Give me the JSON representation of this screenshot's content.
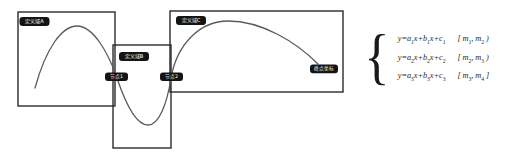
{
  "figure": {
    "background_color": "#ffffff",
    "box_stroke_color": "#2b2b2b",
    "curve_stroke_color": "#5a5a5a",
    "badge_fill_color": "#141414",
    "badge_text_color": "#ffffff"
  },
  "regions": [
    {
      "id": "A",
      "label": "定义域A",
      "x": 18,
      "y": 12,
      "width": 97,
      "height": 94
    },
    {
      "id": "B",
      "label": "定义域B",
      "x": 113,
      "y": 45,
      "width": 58,
      "height": 103
    },
    {
      "id": "C",
      "label": "定义域C",
      "x": 170,
      "y": 11,
      "width": 173,
      "height": 81
    }
  ],
  "nodes": [
    {
      "id": "node1",
      "label": "节点1",
      "x": 116,
      "y": 77
    },
    {
      "id": "node2",
      "label": "节点2",
      "x": 171,
      "y": 77
    },
    {
      "id": "node3",
      "label": "终点坐标",
      "x": 324,
      "y": 69
    }
  ],
  "curve": {
    "description": "continuous piecewise quadratic spline: rising arc, trough, rising arc",
    "start_point": {
      "x": 35,
      "y": 88
    },
    "peak_left": {
      "x": 77,
      "y": 26
    },
    "trough": {
      "x": 148,
      "y": 125
    },
    "peak_right": {
      "x": 228,
      "y": 21
    },
    "end_point": {
      "x": 318,
      "y": 64
    }
  },
  "equations": {
    "brace": "{",
    "rows": [
      {
        "expr_html": "y=a<sub>1</sub>x+b<sub>1</sub>x+c<sub>1</sub>",
        "interval_html": "[ m<sub>1</sub>, m<sub>2</sub> )",
        "expr_text": "y=a1x+b1x+c1",
        "interval_text": "[m1, m2)"
      },
      {
        "expr_html": "y=a<sub>2</sub>x+b<sub>2</sub>x+c<sub>2</sub>",
        "interval_html": "[ m<sub>2</sub>, m<sub>3</sub> )",
        "expr_text": "y=a2x+b2x+c2",
        "interval_text": "[m2, m3)"
      },
      {
        "expr_html": "y=a<sub>3</sub>x+b<sub>3</sub>x+c<sub>3</sub>",
        "interval_html": "[ m<sub>3</sub>, m<sub>4</sub> ]",
        "expr_text": "y=a3x+b3x+c3",
        "interval_text": "[m3, m4]"
      }
    ]
  }
}
